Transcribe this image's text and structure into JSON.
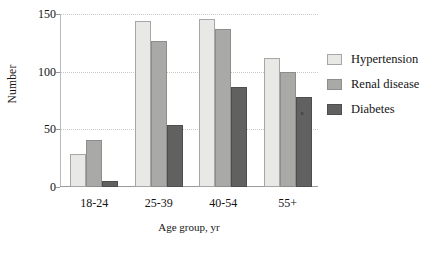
{
  "chart_data": {
    "type": "bar",
    "title": "",
    "xlabel": "Age group, yr",
    "ylabel": "Number",
    "categories": [
      "18-24",
      "25-39",
      "40-54",
      "55+"
    ],
    "series": [
      {
        "name": "Hypertension",
        "values": [
          29,
          144,
          146,
          112
        ],
        "color": "#e8e8e6"
      },
      {
        "name": "Renal disease",
        "values": [
          41,
          127,
          137,
          100
        ],
        "color": "#a9a9a7"
      },
      {
        "name": "Diabetes",
        "values": [
          5,
          54,
          87,
          78
        ],
        "color": "#616161"
      }
    ],
    "ylim": [
      0,
      150
    ],
    "yticks": [
      0,
      50,
      100,
      150
    ],
    "ytick_labels": [
      "0",
      "50",
      "100",
      "150"
    ],
    "grid": true,
    "legend_position": "right",
    "annotations": [
      {
        "text": "s",
        "series": "Diabetes",
        "category": "55+"
      }
    ]
  }
}
